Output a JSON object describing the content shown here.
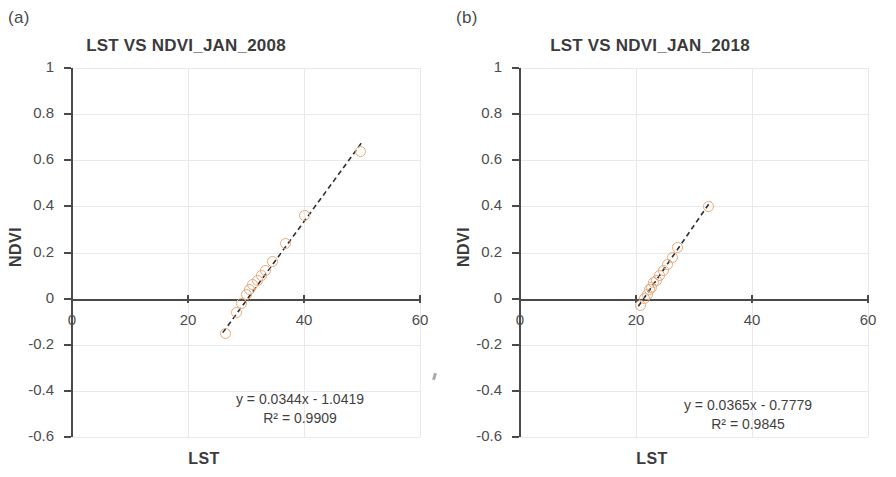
{
  "figure": {
    "panels": [
      {
        "letter": "(a)",
        "title": "LST VS NDVI_JAN_2008",
        "xlabel": "LST",
        "ylabel": "NDVI",
        "equation": "y = 0.0344x - 1.0419",
        "r2": "R² = 0.9909"
      },
      {
        "letter": "(b)",
        "title": "LST VS NDVI_JAN_2018",
        "xlabel": "LST",
        "ylabel": "NDVI",
        "equation": "y = 0.0365x - 0.7779",
        "r2": "R² = 0.9845"
      }
    ],
    "marker_color": "#E7A97A",
    "axis_color": "#4a4a4a",
    "grid_color": "#e9e9ec"
  },
  "chart_data": [
    {
      "type": "scatter",
      "panel": "(a)",
      "title": "LST VS NDVI_JAN_2008",
      "xlabel": "LST",
      "ylabel": "NDVI",
      "xlim": [
        0,
        60
      ],
      "ylim": [
        -0.6,
        1.0
      ],
      "xticks": [
        0,
        20,
        40,
        60
      ],
      "yticks": [
        -0.6,
        -0.4,
        -0.2,
        0,
        0.2,
        0.4,
        0.6,
        0.8,
        1
      ],
      "grid": true,
      "legend": "none",
      "x": [
        26.5,
        28.3,
        29.2,
        30.0,
        30.6,
        31.2,
        31.9,
        32.6,
        33.4,
        34.5,
        36.8,
        40.0,
        49.8
      ],
      "y": [
        -0.15,
        -0.06,
        -0.02,
        0.02,
        0.04,
        0.06,
        0.08,
        0.1,
        0.12,
        0.16,
        0.24,
        0.36,
        0.64
      ],
      "trendline": {
        "type": "linear",
        "slope": 0.0344,
        "intercept": -1.0419,
        "equation": "y = 0.0344x - 1.0419",
        "r_squared": 0.9909,
        "r2_label": "R² = 0.9909",
        "style": "dashed",
        "x_start": 26.0,
        "x_end": 50.2
      }
    },
    {
      "type": "scatter",
      "panel": "(b)",
      "title": "LST VS NDVI_JAN_2018",
      "xlabel": "LST",
      "ylabel": "NDVI",
      "xlim": [
        0,
        60
      ],
      "ylim": [
        -0.6,
        1.0
      ],
      "xticks": [
        0,
        20,
        40,
        60
      ],
      "yticks": [
        -0.6,
        -0.4,
        -0.2,
        0,
        0.2,
        0.4,
        0.6,
        0.8,
        1
      ],
      "grid": true,
      "legend": "none",
      "x": [
        20.7,
        21.4,
        21.9,
        22.3,
        22.7,
        23.1,
        23.6,
        24.1,
        24.7,
        25.4,
        26.3,
        27.1,
        32.5
      ],
      "y": [
        -0.03,
        0.0,
        0.02,
        0.04,
        0.05,
        0.07,
        0.08,
        0.1,
        0.12,
        0.15,
        0.18,
        0.22,
        0.4
      ],
      "trendline": {
        "type": "linear",
        "slope": 0.0365,
        "intercept": -0.7779,
        "equation": "y = 0.0365x - 0.7779",
        "r_squared": 0.9845,
        "r2_label": "R² = 0.9845",
        "style": "dashed",
        "x_start": 20.4,
        "x_end": 32.9
      }
    }
  ]
}
